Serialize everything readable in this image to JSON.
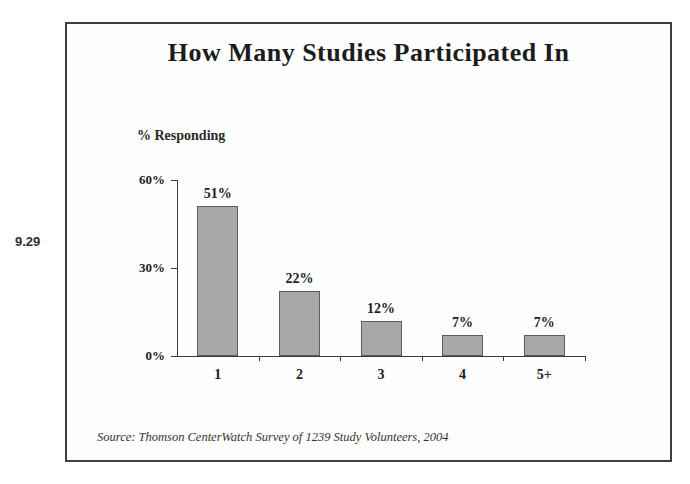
{
  "page": {
    "slide_number": "9.29"
  },
  "chart_data": {
    "type": "bar",
    "title": "How Many Studies Participated In",
    "categories": [
      "1",
      "2",
      "3",
      "4",
      "5+"
    ],
    "values": [
      51,
      22,
      12,
      7,
      7
    ],
    "value_labels": [
      "51%",
      "22%",
      "12%",
      "7%",
      "7%"
    ],
    "xlabel": "",
    "ylabel": "% Responding",
    "ylim": [
      0,
      60
    ],
    "yticks": [
      0,
      30,
      60
    ],
    "ytick_labels": [
      "0%",
      "30%",
      "60%"
    ],
    "grid": false,
    "legend": null,
    "bar_color": "#a8a8a8",
    "bar_border_color": "#5c5c5c",
    "axis_color": "#3c3c3c",
    "source": "Source: Thomson CenterWatch Survey of 1239 Study Volunteers, 2004"
  }
}
